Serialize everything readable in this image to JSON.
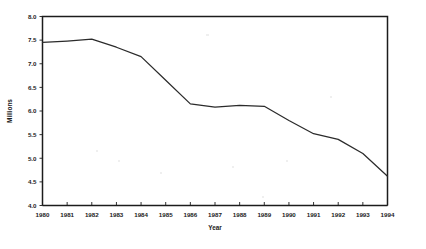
{
  "chart_data": {
    "type": "line",
    "title": "",
    "subtitle": "",
    "xlabel": "Year",
    "ylabel": "Millions",
    "x": [
      1980,
      1981,
      1982,
      1983,
      1984,
      1985,
      1986,
      1987,
      1988,
      1989,
      1990,
      1991,
      1992,
      1993,
      1994
    ],
    "values": [
      7.45,
      7.48,
      7.52,
      7.35,
      7.15,
      6.65,
      6.15,
      6.08,
      6.12,
      6.1,
      5.8,
      5.52,
      5.4,
      5.1,
      4.62
    ],
    "series": [
      {
        "name": "Millions",
        "values": [
          7.45,
          7.48,
          7.52,
          7.35,
          7.15,
          6.65,
          6.15,
          6.08,
          6.12,
          6.1,
          5.8,
          5.52,
          5.4,
          5.1,
          4.62
        ]
      }
    ],
    "xtick_labels": [
      "1980",
      "1981",
      "1982",
      "1983",
      "1984",
      "1985",
      "1986",
      "1987",
      "1988",
      "1989",
      "1990",
      "1991",
      "1992",
      "1993",
      "1994"
    ],
    "ytick_labels": [
      "4.0",
      "4.5",
      "5.0",
      "5.5",
      "6.0",
      "6.5",
      "7.0",
      "7.5",
      "8.0"
    ],
    "ytick_values": [
      4.0,
      4.5,
      5.0,
      5.5,
      6.0,
      6.5,
      7.0,
      7.5,
      8.0
    ],
    "xlim": [
      1980,
      1994
    ],
    "ylim": [
      4.0,
      8.0
    ],
    "grid": false,
    "legend": false,
    "legend_position": "none",
    "line_color": "#2b2b2b",
    "axis_color": "#1c1c1c",
    "background_color": "#ffffff",
    "annotations": []
  }
}
